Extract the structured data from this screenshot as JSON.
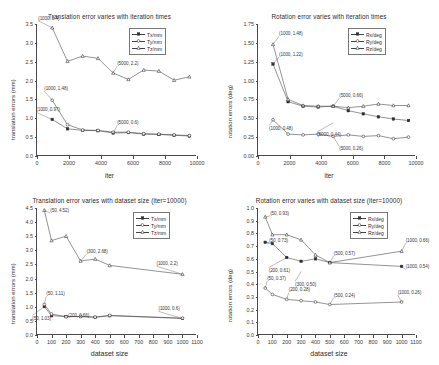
{
  "figure": {
    "panels": [
      {
        "id": "translation-vs-iteration",
        "title": "Translation error varies with iteration times",
        "xlabel": "iter",
        "ylabel": "translation errors (mm)",
        "legend": [
          "Tx/mm",
          "Ty/mm",
          "Tz/mm"
        ],
        "xticks": [
          "0",
          "2000",
          "4000",
          "6000",
          "8000",
          "10000"
        ],
        "yticks": [
          "0.0",
          "0.5",
          "1.0",
          "1.5",
          "2.0",
          "2.5",
          "3.0",
          "3.5"
        ],
        "annotations": [
          "(1000, 3.4)",
          "(1000, 1.48)",
          "(1000, 0.97)",
          "(5000, 2.2)",
          "(5000, 0.6)"
        ]
      },
      {
        "id": "rotation-vs-iteration",
        "title": "Rotation error varies with iteration times",
        "xlabel": "iter",
        "ylabel": "rotation errors (deg)",
        "legend": [
          "Rx/deg",
          "Ry/deg",
          "Rz/deg"
        ],
        "xticks": [
          "0",
          "2000",
          "4000",
          "6000",
          "8000",
          "10000"
        ],
        "yticks": [
          "0.00",
          "0.25",
          "0.50",
          "0.75",
          "1.00",
          "1.25",
          "1.50",
          "1.75"
        ],
        "annotations": [
          "(1000, 1.48)",
          "(1000, 1.22)",
          "(1000, 0.48)",
          "(5000, 0.66)",
          "(5000, 0.44)",
          "(5000, 0.26)"
        ]
      },
      {
        "id": "translation-vs-dataset-size",
        "title": "Translation error varies with dataset size (iter=10000)",
        "xlabel": "dataset size",
        "ylabel": "translation errors (mm)",
        "legend": [
          "Tx/mm",
          "Ty/mm",
          "Tz/mm"
        ],
        "xticks": [
          "0",
          "100",
          "200",
          "300",
          "400",
          "500",
          "600",
          "700",
          "800",
          "900",
          "1000",
          "1100"
        ],
        "yticks": [
          "0.0",
          "0.5",
          "1.0",
          "1.5",
          "2.0",
          "2.5",
          "3.0",
          "3.5",
          "4.0",
          "4.5"
        ],
        "annotations": [
          "(50, 4.52)",
          "(300, 2.68)",
          "(1000, 2.2)",
          "(50, 1.11)",
          "(200, 0.66)",
          "(50, 1.03)",
          "(1000, 0.6)"
        ]
      },
      {
        "id": "rotation-vs-dataset-size",
        "title": "Rotation error varies with dataset size (iter=10000)",
        "xlabel": "dataset size",
        "ylabel": "rotation errors (deg)",
        "legend": [
          "Rx/deg",
          "Ry/deg",
          "Rz/deg"
        ],
        "xticks": [
          "0",
          "100",
          "200",
          "300",
          "400",
          "500",
          "600",
          "700",
          "800",
          "900",
          "1000",
          "1100"
        ],
        "yticks": [
          "0.0",
          "0.1",
          "0.2",
          "0.3",
          "0.4",
          "0.5",
          "0.6",
          "0.7",
          "0.8",
          "0.9",
          "1.0"
        ],
        "annotations": [
          "(50, 0.93)",
          "(50, 0.73)",
          "(200, 0.61)",
          "(300, 0.50)",
          "(500, 0.57)",
          "(1000, 0.66)",
          "(1000, 0.54)",
          "(50, 0.37)",
          "(200, 0.28)",
          "(500, 0.24)",
          "(1000, 0.26)"
        ]
      }
    ]
  },
  "chart_data": [
    {
      "type": "line",
      "title": "Translation error varies with iteration times",
      "xlabel": "iter",
      "ylabel": "translation errors (mm)",
      "xlim": [
        0,
        10500
      ],
      "ylim": [
        0.0,
        3.5
      ],
      "grid": false,
      "legend_position": "top-right",
      "x": [
        1000,
        2000,
        3000,
        4000,
        5000,
        6000,
        7000,
        8000,
        9000,
        10000
      ],
      "series": [
        {
          "name": "Tx/mm",
          "values": [
            0.97,
            0.72,
            0.68,
            0.67,
            0.61,
            0.62,
            0.58,
            0.57,
            0.55,
            0.53
          ]
        },
        {
          "name": "Ty/mm",
          "values": [
            1.48,
            0.83,
            0.69,
            0.68,
            0.63,
            0.63,
            0.59,
            0.58,
            0.56,
            0.54
          ]
        },
        {
          "name": "Tz/mm",
          "values": [
            3.4,
            2.51,
            2.65,
            2.59,
            2.2,
            2.03,
            2.28,
            2.25,
            2.01,
            2.1
          ]
        }
      ],
      "annotations": [
        {
          "label": "(1000, 3.4)",
          "x": 1000,
          "y": 3.4
        },
        {
          "label": "(1000, 1.48)",
          "x": 1000,
          "y": 1.48
        },
        {
          "label": "(1000, 0.97)",
          "x": 1000,
          "y": 0.97
        },
        {
          "label": "(5000, 2.2)",
          "x": 5000,
          "y": 2.2
        },
        {
          "label": "(5000, 0.6)",
          "x": 5000,
          "y": 0.6
        }
      ]
    },
    {
      "type": "line",
      "title": "Rotation error varies with iteration times",
      "xlabel": "iter",
      "ylabel": "rotation errors (deg)",
      "xlim": [
        0,
        10500
      ],
      "ylim": [
        0.0,
        1.75
      ],
      "grid": false,
      "legend_position": "top-right",
      "x": [
        1000,
        2000,
        3000,
        4000,
        5000,
        6000,
        7000,
        8000,
        9000,
        10000
      ],
      "series": [
        {
          "name": "Rx/deg",
          "values": [
            1.22,
            0.72,
            0.66,
            0.65,
            0.66,
            0.6,
            0.56,
            0.52,
            0.49,
            0.47
          ]
        },
        {
          "name": "Ry/deg",
          "values": [
            0.48,
            0.29,
            0.28,
            0.29,
            0.26,
            0.28,
            0.26,
            0.27,
            0.23,
            0.25
          ]
        },
        {
          "name": "Rz/deg",
          "values": [
            1.48,
            0.75,
            0.67,
            0.66,
            0.66,
            0.64,
            0.66,
            0.69,
            0.67,
            0.67
          ]
        }
      ],
      "annotations": [
        {
          "label": "(1000, 1.48)",
          "x": 1000,
          "y": 1.48
        },
        {
          "label": "(1000, 1.22)",
          "x": 1000,
          "y": 1.22
        },
        {
          "label": "(1000, 0.48)",
          "x": 1000,
          "y": 0.48
        },
        {
          "label": "(5000, 0.66)",
          "x": 5000,
          "y": 0.66
        },
        {
          "label": "(5000, 0.44)",
          "x": 5000,
          "y": 0.44
        },
        {
          "label": "(5000, 0.26)",
          "x": 5000,
          "y": 0.26
        }
      ]
    },
    {
      "type": "line",
      "title": "Translation error varies with dataset size (iter=10000)",
      "xlabel": "dataset size",
      "ylabel": "translation errors (mm)",
      "xlim": [
        0,
        1100
      ],
      "ylim": [
        0.0,
        4.6
      ],
      "grid": false,
      "legend_position": "top-right",
      "x": [
        50,
        100,
        200,
        300,
        400,
        500,
        1000
      ],
      "series": [
        {
          "name": "Tx/mm",
          "values": [
            1.03,
            0.7,
            0.67,
            0.67,
            0.64,
            0.7,
            0.6
          ]
        },
        {
          "name": "Ty/mm",
          "values": [
            1.11,
            0.76,
            0.66,
            0.67,
            0.65,
            0.71,
            0.61
          ]
        },
        {
          "name": "Tz/mm",
          "values": [
            4.52,
            3.42,
            3.58,
            2.68,
            2.75,
            2.52,
            2.2
          ]
        }
      ],
      "annotations": [
        {
          "label": "(50, 4.52)",
          "x": 50,
          "y": 4.52
        },
        {
          "label": "(300, 2.68)",
          "x": 300,
          "y": 2.68
        },
        {
          "label": "(1000, 2.2)",
          "x": 1000,
          "y": 2.2
        },
        {
          "label": "(50, 1.11)",
          "x": 50,
          "y": 1.11
        },
        {
          "label": "(200, 0.66)",
          "x": 200,
          "y": 0.66
        },
        {
          "label": "(50, 1.03)",
          "x": 50,
          "y": 1.03
        },
        {
          "label": "(1000, 0.6)",
          "x": 1000,
          "y": 0.6
        }
      ]
    },
    {
      "type": "line",
      "title": "Rotation error varies with dataset size (iter=10000)",
      "xlabel": "dataset size",
      "ylabel": "rotation errors (deg)",
      "xlim": [
        0,
        1100
      ],
      "ylim": [
        0.0,
        1.0
      ],
      "grid": false,
      "legend_position": "top-right",
      "x": [
        50,
        100,
        200,
        300,
        400,
        500,
        1000
      ],
      "series": [
        {
          "name": "Rx/deg",
          "values": [
            0.73,
            0.72,
            0.61,
            0.58,
            0.6,
            0.57,
            0.54
          ]
        },
        {
          "name": "Ry/deg",
          "values": [
            0.37,
            0.32,
            0.28,
            0.27,
            0.26,
            0.24,
            0.26
          ]
        },
        {
          "name": "Rz/deg",
          "values": [
            0.93,
            0.79,
            0.79,
            0.75,
            0.63,
            0.57,
            0.66
          ]
        }
      ],
      "annotations": [
        {
          "label": "(50, 0.93)",
          "x": 50,
          "y": 0.93
        },
        {
          "label": "(50, 0.73)",
          "x": 50,
          "y": 0.73
        },
        {
          "label": "(200, 0.61)",
          "x": 200,
          "y": 0.61
        },
        {
          "label": "(300, 0.50)",
          "x": 300,
          "y": 0.5
        },
        {
          "label": "(500, 0.57)",
          "x": 500,
          "y": 0.57
        },
        {
          "label": "(1000, 0.66)",
          "x": 1000,
          "y": 0.66
        },
        {
          "label": "(1000, 0.54)",
          "x": 1000,
          "y": 0.54
        },
        {
          "label": "(50, 0.37)",
          "x": 50,
          "y": 0.37
        },
        {
          "label": "(200, 0.28)",
          "x": 200,
          "y": 0.28
        },
        {
          "label": "(500, 0.24)",
          "x": 500,
          "y": 0.24
        },
        {
          "label": "(1000, 0.26)",
          "x": 1000,
          "y": 0.26
        }
      ]
    }
  ]
}
